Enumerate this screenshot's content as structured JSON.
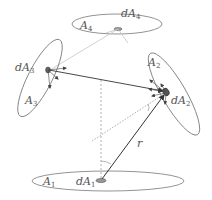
{
  "diagram": {
    "surfaces": [
      {
        "id": "A1",
        "label": "A",
        "sub": "1",
        "patch_label": "dA",
        "patch_sub": "1"
      },
      {
        "id": "A2",
        "label": "A",
        "sub": "2",
        "patch_label": "dA",
        "patch_sub": "2"
      },
      {
        "id": "A3",
        "label": "A",
        "sub": "3",
        "patch_label": "dA",
        "patch_sub": "3"
      },
      {
        "id": "A4",
        "label": "A",
        "sub": "4",
        "patch_label": "dA",
        "patch_sub": "4"
      }
    ],
    "distance_label": "r",
    "colors": {
      "outline": "#777777",
      "ray": "#333333",
      "light_ray": "#bbbbbb",
      "dashed": "#999999",
      "patch": "#888888"
    }
  }
}
